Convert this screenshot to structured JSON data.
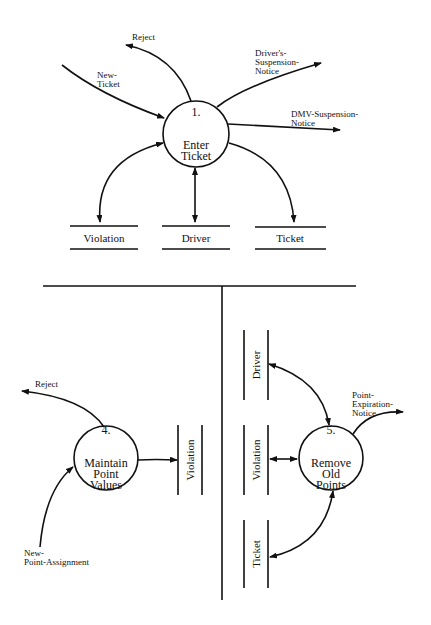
{
  "diagram": {
    "type": "data-flow-diagram",
    "top_section": {
      "process": {
        "number": "1.",
        "name": "Enter\nTicket"
      },
      "data_stores": [
        {
          "label": "Violation"
        },
        {
          "label": "Driver"
        },
        {
          "label": "Ticket"
        }
      ],
      "flows": [
        {
          "label": "New-\nTicket",
          "direction": "in"
        },
        {
          "label": "Reject",
          "direction": "out"
        },
        {
          "label": "Driver's-\nSuspension-\nNotice",
          "direction": "out"
        },
        {
          "label": "DMV-Suspension-\nNotice",
          "direction": "out"
        }
      ]
    },
    "bottom_left": {
      "process": {
        "number": "4.",
        "name": "Maintain\nPoint\nValues"
      },
      "data_store": {
        "label": "Violation"
      },
      "flows": [
        {
          "label": "Reject",
          "direction": "out"
        },
        {
          "label": "New-\nPoint-Assignment",
          "direction": "in"
        }
      ]
    },
    "bottom_right": {
      "process": {
        "number": "5.",
        "name": "Remove\nOld\nPoints"
      },
      "data_stores": [
        {
          "label": "Driver"
        },
        {
          "label": "Violation"
        },
        {
          "label": "Ticket"
        }
      ],
      "flows": [
        {
          "label": "Point-\nExpiration-\nNotice",
          "direction": "out"
        }
      ]
    }
  }
}
